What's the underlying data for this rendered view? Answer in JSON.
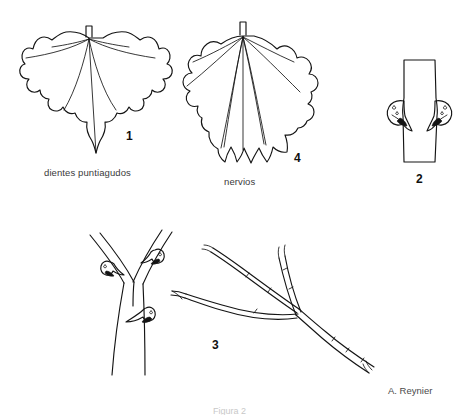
{
  "plate": {
    "title": "Lamina botanica de la vid",
    "background_color": "#ffffff",
    "ink_color": "#141414",
    "signature": "A. Reynier",
    "plate_caption": "Figura 2"
  },
  "figures": [
    {
      "number": "1",
      "name": "leaf-pointed-teeth",
      "caption": "dientes puntiagudos",
      "description": "Hoja de vid con margen de dientes puntiagudos"
    },
    {
      "number": "4",
      "name": "leaf-veins",
      "caption": "nervios",
      "description": "Hoja de vid mostrando los nervios principales"
    },
    {
      "number": "2",
      "name": "stem-node-buds",
      "caption": "",
      "description": "Nudo del sarmiento con yemas laterales opuestas"
    },
    {
      "number": "3",
      "name": "shoot-tendril",
      "caption": "",
      "description": "Sarmiento ramificado con zarcillo y nudos"
    }
  ],
  "labels": {
    "dientes": "dientes puntiagudos",
    "nervios": "nervios",
    "num_1": "1",
    "num_2": "2",
    "num_3": "3",
    "num_4": "4"
  }
}
